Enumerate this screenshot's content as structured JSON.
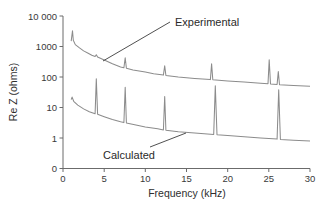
{
  "chart_data": {
    "type": "line",
    "title": "",
    "xlabel": "Frequency (kHz)",
    "ylabel": "Re Z (ohms)",
    "x_scale": "linear",
    "y_scale": "log",
    "xlim": [
      0,
      30
    ],
    "ylim_labels": [
      "0",
      "1",
      "10",
      "100",
      "1000",
      "10 000"
    ],
    "x_ticks": [
      0,
      5,
      10,
      15,
      20,
      25,
      30
    ],
    "x_tick_labels": [
      "0",
      "5",
      "10",
      "15",
      "20",
      "25",
      "30"
    ],
    "y_ticks": [
      0.1,
      1,
      10,
      100,
      1000,
      10000
    ],
    "y_tick_labels": [
      "0",
      "1",
      "10",
      "100",
      "1000",
      "10 000"
    ],
    "grid": false,
    "legend": "none (series identified by annotation labels with leader lines)",
    "annotations": [
      {
        "text": "Experimental",
        "points_to": "upper curve near 7.7 kHz"
      },
      {
        "text": "Calculated",
        "points_to": "lower curve near 22 kHz"
      }
    ],
    "series": [
      {
        "name": "Experimental",
        "color": "#8c8c8c",
        "points": [
          [
            1.0,
            1500
          ],
          [
            1.15,
            3300
          ],
          [
            1.25,
            1600
          ],
          [
            1.5,
            1150
          ],
          [
            2.0,
            900
          ],
          [
            2.5,
            720
          ],
          [
            3.0,
            610
          ],
          [
            3.5,
            520
          ],
          [
            3.9,
            470
          ],
          [
            4.05,
            540
          ],
          [
            4.2,
            450
          ],
          [
            5.0,
            360
          ],
          [
            6.0,
            270
          ],
          [
            7.0,
            215
          ],
          [
            7.4,
            200
          ],
          [
            7.55,
            430
          ],
          [
            7.7,
            195
          ],
          [
            8.5,
            170
          ],
          [
            10.0,
            145
          ],
          [
            11.0,
            128
          ],
          [
            12.2,
            115
          ],
          [
            12.35,
            235
          ],
          [
            12.5,
            112
          ],
          [
            14.0,
            100
          ],
          [
            16.0,
            90
          ],
          [
            17.9,
            82
          ],
          [
            18.05,
            270
          ],
          [
            18.2,
            81
          ],
          [
            20.0,
            74
          ],
          [
            22.0,
            68
          ],
          [
            24.0,
            62
          ],
          [
            24.9,
            60
          ],
          [
            25.05,
            370
          ],
          [
            25.2,
            59
          ],
          [
            26.0,
            57
          ],
          [
            26.15,
            150
          ],
          [
            26.3,
            56
          ],
          [
            28.0,
            53
          ],
          [
            30.0,
            50
          ]
        ]
      },
      {
        "name": "Calculated",
        "color": "#8c8c8c",
        "points": [
          [
            1.0,
            18
          ],
          [
            1.1,
            22
          ],
          [
            1.3,
            16
          ],
          [
            1.8,
            12
          ],
          [
            2.5,
            9
          ],
          [
            3.2,
            7.3
          ],
          [
            3.9,
            6.2
          ],
          [
            4.05,
            88
          ],
          [
            4.2,
            6.0
          ],
          [
            5.0,
            5.0
          ],
          [
            6.0,
            4.0
          ],
          [
            7.0,
            3.4
          ],
          [
            7.4,
            3.2
          ],
          [
            7.55,
            46
          ],
          [
            7.7,
            3.1
          ],
          [
            9.0,
            2.6
          ],
          [
            10.0,
            2.3
          ],
          [
            11.5,
            2.0
          ],
          [
            12.2,
            1.85
          ],
          [
            12.35,
            23
          ],
          [
            12.5,
            1.8
          ],
          [
            14.0,
            1.6
          ],
          [
            16.0,
            1.45
          ],
          [
            18.3,
            1.3
          ],
          [
            18.5,
            52
          ],
          [
            18.7,
            1.28
          ],
          [
            20.0,
            1.2
          ],
          [
            22.0,
            1.1
          ],
          [
            24.0,
            1.0
          ],
          [
            26.0,
            0.92
          ],
          [
            26.2,
            38
          ],
          [
            26.4,
            0.9
          ],
          [
            28.0,
            0.85
          ],
          [
            30.0,
            0.8
          ]
        ]
      }
    ]
  },
  "axes": {
    "x_title": "Frequency (kHz)",
    "y_title": "Re Z (ohms)",
    "x_tick_labels": [
      "0",
      "5",
      "10",
      "15",
      "20",
      "25",
      "30"
    ],
    "y_tick_labels": [
      "0",
      "1",
      "10",
      "100",
      "1000",
      "10 000"
    ]
  },
  "annotations": {
    "experimental": "Experimental",
    "calculated": "Calculated"
  },
  "colors": {
    "series": "#8c8c8c",
    "axis": "#6b6b6b",
    "text": "#2e2e2e",
    "background": "#ffffff"
  }
}
